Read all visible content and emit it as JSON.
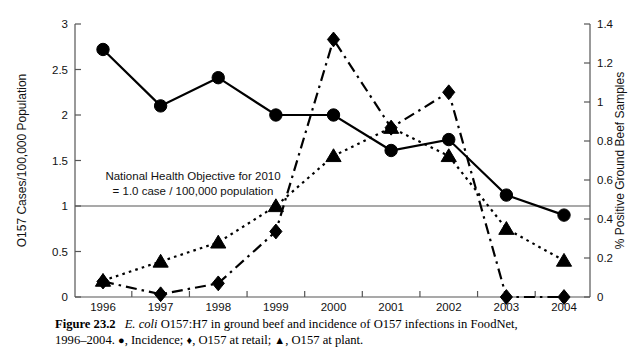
{
  "figure": {
    "label": "Figure 23.2",
    "title_italic": "E. coli",
    "title_rest": " O157:H7 in ground beef and incidence of O157 infections in FoodNet,",
    "line2_prefix": "1996–2004. ",
    "legend": [
      {
        "glyph": "●",
        "text": ", Incidence; "
      },
      {
        "glyph": "♦",
        "text": ", O157 at retail; "
      },
      {
        "glyph": "▲",
        "text": ", O157 at plant."
      }
    ]
  },
  "annotation": {
    "line1": "National Health Objective for 2010",
    "line2": "= 1.0 case / 100,000 population",
    "objective_value": 1.0
  },
  "chart_data": {
    "type": "line",
    "title": "",
    "xlabel": "",
    "ylabel": "O157 Cases/100,000 Population",
    "y2label": "% Positive Ground Beef Samples",
    "grid": false,
    "legend_position": "caption",
    "categories": [
      "1996",
      "1997",
      "1998",
      "1999",
      "2000",
      "2001",
      "2002",
      "2003",
      "2004"
    ],
    "x": [
      1996,
      1997,
      1998,
      1999,
      2000,
      2001,
      2002,
      2003,
      2004
    ],
    "ylim": [
      0,
      3
    ],
    "yticks": [
      0,
      0.5,
      1,
      1.5,
      2,
      2.5,
      3
    ],
    "yticklabels": [
      "0",
      "0.5",
      "1",
      "1.5",
      "2",
      "2.5",
      "3"
    ],
    "y2lim": [
      0,
      1.4
    ],
    "y2ticks": [
      0,
      0.2,
      0.4,
      0.6,
      0.8,
      1.0,
      1.2,
      1.4
    ],
    "y2ticklabels": [
      "0",
      "0.2",
      "0.4",
      "0.6",
      "0.8",
      "1",
      "1.2",
      "1.4"
    ],
    "series": [
      {
        "name": "Incidence",
        "marker": "circle",
        "linestyle": "solid",
        "axis": "left",
        "values": [
          2.72,
          2.1,
          2.41,
          2.0,
          2.0,
          1.61,
          1.73,
          1.12,
          0.9
        ]
      },
      {
        "name": "O157 at retail",
        "marker": "diamond",
        "linestyle": "dash-dot",
        "axis": "right",
        "values_left_scale": [
          0.17,
          0.03,
          0.15,
          0.72,
          2.83,
          1.86,
          2.25,
          0.0,
          0.0
        ],
        "values": [
          0.08,
          0.01,
          0.07,
          0.34,
          1.32,
          0.87,
          1.05,
          0.0,
          0.0
        ]
      },
      {
        "name": "O157 at plant",
        "marker": "triangle",
        "linestyle": "dotted",
        "axis": "right",
        "values_left_scale": [
          0.18,
          0.39,
          0.6,
          1.0,
          1.55,
          1.86,
          1.55,
          0.75,
          0.4
        ],
        "values": [
          0.08,
          0.18,
          0.28,
          0.47,
          0.72,
          0.87,
          0.72,
          0.35,
          0.19
        ]
      }
    ]
  }
}
